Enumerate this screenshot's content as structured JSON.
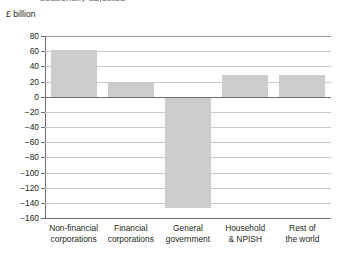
{
  "title_fragment": "seasonally adjusted",
  "units_label": "£ billion",
  "chart_data": {
    "type": "bar",
    "title": "",
    "subtitle": "",
    "xlabel": "",
    "ylabel": "£ billion",
    "categories": [
      "Non-financial\ncorporations",
      "Financial\ncorporations",
      "General\ngovernment",
      "Household\n& NPISH",
      "Rest of\nthe world"
    ],
    "values": [
      62,
      18,
      -147,
      29,
      29
    ],
    "ylim": [
      -160,
      80
    ],
    "ytick_step": 20,
    "yticks": [
      80,
      60,
      40,
      20,
      0,
      -20,
      -40,
      -60,
      -80,
      -100,
      -120,
      -140,
      -160
    ],
    "ytick_labels": [
      "80",
      "60",
      "40",
      "20",
      "0",
      "−20",
      "−40",
      "−60",
      "−80",
      "−100",
      "−120",
      "−140",
      "−160"
    ],
    "grid": true,
    "legend": false,
    "bar_color": "#cccccc",
    "gridline_color": "#c9c9c9",
    "axis_color": "#6d6d6d"
  }
}
